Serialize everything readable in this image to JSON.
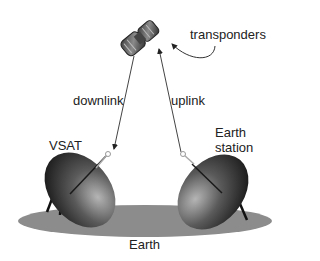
{
  "diagram": {
    "type": "satellite-communication",
    "labels": {
      "transponders": "transponders",
      "downlink": "downlink",
      "uplink": "uplink",
      "vsat": "VSAT",
      "earth_station_line1": "Earth",
      "earth_station_line2": "station",
      "earth": "Earth"
    },
    "nodes": [
      {
        "id": "satellite",
        "label": "transponders"
      },
      {
        "id": "vsat",
        "label": "VSAT"
      },
      {
        "id": "earth-station",
        "label": "Earth station"
      },
      {
        "id": "earth",
        "label": "Earth"
      }
    ],
    "edges": [
      {
        "from": "satellite",
        "to": "vsat",
        "label": "downlink"
      },
      {
        "from": "earth-station",
        "to": "satellite",
        "label": "uplink"
      }
    ],
    "colors": {
      "earth": "#8c8c8c",
      "dish_dark": "#1e1e1e",
      "dish_light": "#9a9a9a",
      "line": "#555555"
    }
  }
}
